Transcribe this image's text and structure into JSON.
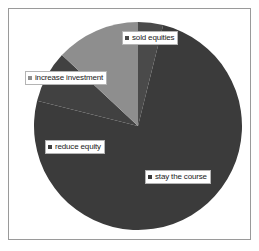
{
  "chart_data": {
    "type": "pie",
    "title": "",
    "subtitle": "",
    "xlabel": "",
    "ylabel": "",
    "legend_position": "none",
    "grid": false,
    "labels_on_slices": true,
    "categories": [
      "sold equities",
      "stay the course",
      "reduce equity",
      "increase investment"
    ],
    "values": [
      4,
      75,
      8,
      13
    ],
    "unit": "percent",
    "colors": [
      "#4a4a4a",
      "#3b3b3b",
      "#414141",
      "#8e8e8e"
    ],
    "slices": [
      {
        "label": "sold equities",
        "value": 4,
        "color": "#4a4a4a",
        "start_angle_deg": 0,
        "end_angle_deg": 14
      },
      {
        "label": "stay the course",
        "value": 75,
        "color": "#3b3b3b",
        "start_angle_deg": 14,
        "end_angle_deg": 284
      },
      {
        "label": "reduce equity",
        "value": 8,
        "color": "#414141",
        "start_angle_deg": 284,
        "end_angle_deg": 313
      },
      {
        "label": "increase investment",
        "value": 13,
        "color": "#8e8e8e",
        "start_angle_deg": 313,
        "end_angle_deg": 360
      }
    ]
  },
  "chart": {
    "geometry": {
      "center_x": 129,
      "center_y": 117,
      "radius": 104
    },
    "labels": [
      {
        "id": "sold-equities",
        "text": "sold equities",
        "marker_color": "#4a4a4a"
      },
      {
        "id": "increase-investment",
        "text": "increase investment",
        "marker_color": "#8e8e8e"
      },
      {
        "id": "reduce-equity",
        "text": "reduce equity",
        "marker_color": "#414141"
      },
      {
        "id": "stay-the-course",
        "text": "stay the course",
        "marker_color": "#3b3b3b"
      }
    ]
  },
  "style": {
    "background": "#ffffff",
    "frame_border": "#9a9a9a",
    "label_box_background": "#ffffff",
    "label_box_border": "#b4b4b4",
    "label_text_color": "#1a1a1a"
  }
}
